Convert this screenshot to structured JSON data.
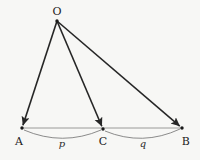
{
  "figure": {
    "type": "geometry-diagram",
    "background_color": "#f7f7f5",
    "width": 200,
    "height": 160,
    "vertices": [
      {
        "id": "O",
        "label": "O",
        "x": 57,
        "y": 21,
        "label_x": 57,
        "label_y": 11
      },
      {
        "id": "A",
        "label": "A",
        "x": 22,
        "y": 128,
        "label_x": 19,
        "label_y": 141
      },
      {
        "id": "C",
        "label": "C",
        "x": 103,
        "y": 129,
        "label_x": 103,
        "label_y": 141
      },
      {
        "id": "B",
        "label": "B",
        "x": 182,
        "y": 128,
        "label_x": 186,
        "label_y": 141
      }
    ],
    "arrows": [
      {
        "id": "OA",
        "from": "O",
        "to": "A",
        "color": "#262626",
        "width": 1.6,
        "arrowhead": true
      },
      {
        "id": "OC",
        "from": "O",
        "to": "C",
        "color": "#262626",
        "width": 1.6,
        "arrowhead": true
      },
      {
        "id": "OB",
        "from": "O",
        "to": "B",
        "color": "#262626",
        "width": 1.6,
        "arrowhead": true
      }
    ],
    "baseline": {
      "id": "AB",
      "from": "A",
      "to": "B",
      "color": "#8f8f8f",
      "width": 0.9
    },
    "arcs": [
      {
        "id": "arc-p",
        "from": "A",
        "to": "C",
        "label": "p",
        "label_x": 62,
        "label_y": 144,
        "color": "#6e6e6e",
        "sag": 11
      },
      {
        "id": "arc-q",
        "from": "C",
        "to": "B",
        "label": "q",
        "label_x": 143,
        "label_y": 144,
        "color": "#6e6e6e",
        "sag": 11
      }
    ],
    "colors": {
      "stroke_dark": "#262626",
      "stroke_light": "#8f8f8f",
      "arc": "#6e6e6e",
      "text": "#1a1a1a",
      "background": "#f7f7f5"
    }
  }
}
